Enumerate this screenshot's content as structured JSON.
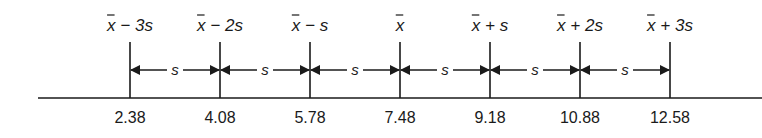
{
  "diagram": {
    "baseline": {
      "x_start": 38,
      "x_end": 762,
      "y": 98
    },
    "interval_label": "s",
    "ticks": [
      {
        "label_main": "x",
        "label_suffix": " − 3s",
        "value": "2.38",
        "x": 130
      },
      {
        "label_main": "x",
        "label_suffix": " − 2s",
        "value": "4.08",
        "x": 220
      },
      {
        "label_main": "x",
        "label_suffix": " − s",
        "value": "5.78",
        "x": 310
      },
      {
        "label_main": "x",
        "label_suffix": "",
        "value": "7.48",
        "x": 400
      },
      {
        "label_main": "x",
        "label_suffix": " + s",
        "value": "9.18",
        "x": 490
      },
      {
        "label_main": "x",
        "label_suffix": " + 2s",
        "value": "10.88",
        "x": 580
      },
      {
        "label_main": "x",
        "label_suffix": " + 3s",
        "value": "12.58",
        "x": 670
      }
    ]
  }
}
